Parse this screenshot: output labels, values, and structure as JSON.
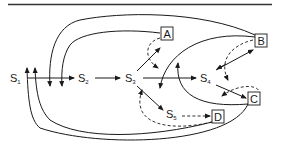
{
  "diagram": {
    "type": "state-transition",
    "states": [
      {
        "id": "S1",
        "base": "S",
        "sub": "1"
      },
      {
        "id": "S2",
        "base": "S",
        "sub": "2"
      },
      {
        "id": "S3",
        "base": "S",
        "sub": "3"
      },
      {
        "id": "S4",
        "base": "S",
        "sub": "4"
      },
      {
        "id": "S5",
        "base": "S",
        "sub": "5"
      }
    ],
    "outcomes": [
      {
        "id": "A",
        "label": "A"
      },
      {
        "id": "B",
        "label": "B"
      },
      {
        "id": "C",
        "label": "C"
      },
      {
        "id": "D",
        "label": "D"
      }
    ],
    "edges": [
      {
        "from": "S1",
        "to": "S2",
        "style": "solid"
      },
      {
        "from": "S2",
        "to": "S3",
        "style": "solid"
      },
      {
        "from": "S3",
        "to": "S4",
        "style": "solid"
      },
      {
        "from": "S3",
        "to": "S5",
        "style": "solid"
      },
      {
        "from": "S3",
        "to": "A",
        "style": "solid"
      },
      {
        "from": "S4",
        "to": "B",
        "style": "solid"
      },
      {
        "from": "S4",
        "to": "C",
        "style": "solid"
      },
      {
        "from": "S5",
        "to": "D",
        "style": "dashed"
      },
      {
        "from": "A",
        "to": "S3",
        "style": "dashed"
      },
      {
        "from": "B",
        "to": "S4",
        "style": "dashed"
      },
      {
        "from": "C",
        "to": "S4",
        "style": "dashed"
      },
      {
        "from": "D",
        "to": "S3",
        "style": "dashed"
      },
      {
        "from": "B",
        "to": "S3",
        "style": "solid"
      },
      {
        "from": "C",
        "to": "S4",
        "style": "solid"
      },
      {
        "from": "B",
        "to": "S1",
        "style": "solid"
      },
      {
        "from": "A",
        "to": "S1",
        "style": "solid"
      },
      {
        "from": "C",
        "to": "S1",
        "style": "solid"
      },
      {
        "from": "D",
        "to": "S1",
        "style": "solid"
      }
    ]
  }
}
